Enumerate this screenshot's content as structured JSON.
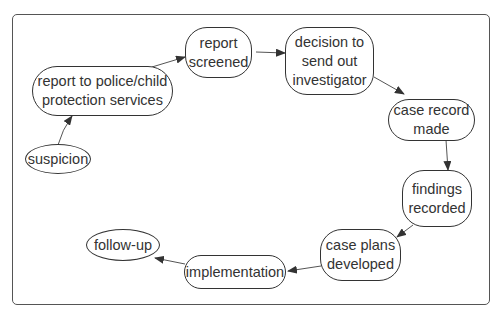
{
  "diagram": {
    "type": "flowchart",
    "nodes": [
      {
        "id": "suspicion",
        "label": "suspicion"
      },
      {
        "id": "report",
        "label": "report to police/child\nprotection services"
      },
      {
        "id": "screened",
        "label": "report\nscreened"
      },
      {
        "id": "decision",
        "label": "decision to\nsend out\ninvestigator"
      },
      {
        "id": "caserecord",
        "label": "case record\nmade"
      },
      {
        "id": "findings",
        "label": "findings\nrecorded"
      },
      {
        "id": "caseplans",
        "label": "case plans\ndeveloped"
      },
      {
        "id": "implementation",
        "label": "implementation"
      },
      {
        "id": "followup",
        "label": "follow-up"
      }
    ],
    "edges": [
      {
        "from": "suspicion",
        "to": "report"
      },
      {
        "from": "report",
        "to": "screened"
      },
      {
        "from": "screened",
        "to": "decision"
      },
      {
        "from": "decision",
        "to": "caserecord"
      },
      {
        "from": "caserecord",
        "to": "findings"
      },
      {
        "from": "findings",
        "to": "caseplans"
      },
      {
        "from": "caseplans",
        "to": "implementation"
      },
      {
        "from": "implementation",
        "to": "followup"
      }
    ],
    "colors": {
      "stroke": "#333333",
      "background": "#ffffff"
    }
  }
}
